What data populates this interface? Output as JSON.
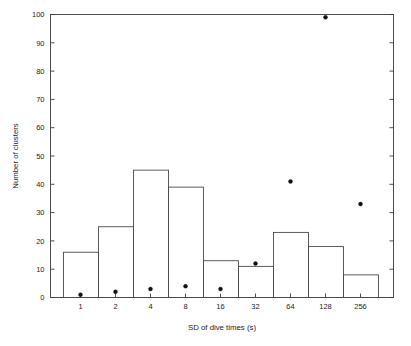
{
  "chart_data": {
    "type": "bar",
    "title": "",
    "subtitle": "",
    "xlabel": "SD of dive times (s)",
    "ylabel": "Number of clusters",
    "categories": [
      "1",
      "2",
      "4",
      "8",
      "16",
      "32",
      "64",
      "128",
      "256"
    ],
    "values": [
      16,
      25,
      45,
      39,
      13,
      11,
      23,
      18,
      8
    ],
    "series": [
      {
        "name": "Number of clusters",
        "type": "bar",
        "values": [
          16,
          25,
          45,
          39,
          13,
          11,
          23,
          18,
          8
        ]
      },
      {
        "name": "point-overlay",
        "type": "scatter",
        "values": [
          1,
          2,
          3,
          4,
          3,
          12,
          41,
          99,
          33
        ]
      }
    ],
    "ylim": [
      0,
      100
    ],
    "ytick_labels": [
      "0",
      "10",
      "20",
      "30",
      "40",
      "50",
      "60",
      "70",
      "80",
      "90",
      "100"
    ],
    "ytick_values": [
      0,
      10,
      20,
      30,
      40,
      50,
      60,
      70,
      80,
      90,
      100
    ],
    "xtick_labels": [
      "1",
      "2",
      "4",
      "8",
      "16",
      "32",
      "64",
      "128",
      "256"
    ],
    "grid": false,
    "legend": "none",
    "marker_color": "#111111",
    "bar_edge_color": "#4a4a4a",
    "bar_fill_color": "none",
    "background_color": "#ffffff"
  },
  "figure": {
    "y_axis_title": "Number of clusters",
    "x_axis_title": "SD of dive times (s)"
  }
}
